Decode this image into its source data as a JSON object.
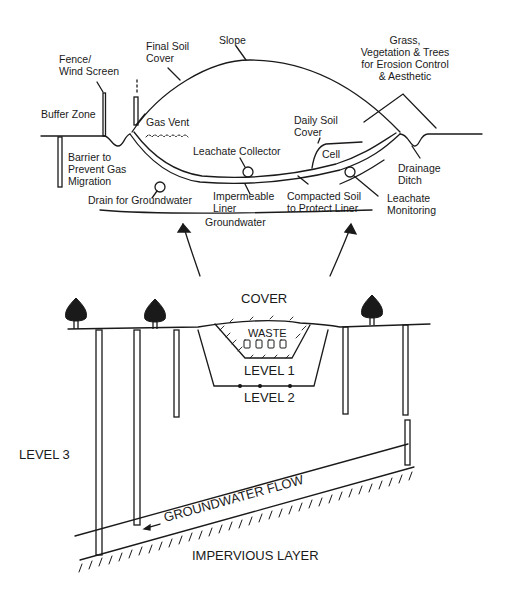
{
  "top_diagram": {
    "labels": {
      "fence": [
        "Fence/",
        "Wind Screen"
      ],
      "final_soil_cover": [
        "Final Soil",
        "Cover"
      ],
      "slope": "Slope",
      "grass": [
        "Grass,",
        "Vegetation & Trees",
        "for Erosion Control",
        "& Aesthetic"
      ],
      "buffer_zone": "Buffer Zone",
      "gas_vent": "Gas Vent",
      "daily_soil_cover": [
        "Daily Soil",
        "Cover"
      ],
      "cell": "Cell",
      "leachate_collector": "Leachate Collector",
      "barrier": [
        "Barrier to",
        "Prevent Gas",
        "Migration"
      ],
      "drainage_ditch": [
        "Drainage",
        "Ditch"
      ],
      "drain_for_groundwater": "Drain for Groundwater",
      "impermeable_liner": [
        "Impermeable",
        "Liner"
      ],
      "compacted_soil": [
        "Compacted Soil",
        "to Protect Liner"
      ],
      "leachate_monitoring": [
        "Leachate",
        "Monitoring"
      ],
      "groundwater": "Groundwater"
    }
  },
  "bottom_diagram": {
    "labels": {
      "cover": "COVER",
      "waste": "WASTE",
      "level1": "LEVEL 1",
      "level2": "LEVEL 2",
      "level3": "LEVEL 3",
      "groundwater_flow": "GROUNDWATER FLOW",
      "impervious_layer": "IMPERVIOUS LAYER"
    }
  },
  "colors": {
    "ink": "#1a1a1a",
    "background": "#ffffff"
  }
}
